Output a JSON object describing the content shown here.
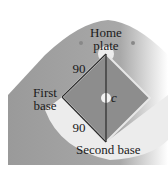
{
  "diagram": {
    "labels": {
      "home_plate_line1": "Home",
      "home_plate_line2": "plate",
      "first_base_line1": "First",
      "first_base_line2": "base",
      "second_base": "Second base",
      "side_top": "90",
      "side_bottom": "90",
      "diagonal": "c"
    },
    "colors": {
      "outfield": "#9c9c9c",
      "infield": "#8a8a8a",
      "dirt": "#f2f2f2",
      "lines": "#2a2a2a"
    }
  }
}
